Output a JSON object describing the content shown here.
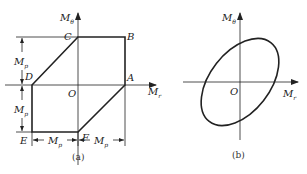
{
  "panel_a": {
    "caption": "(a)",
    "axis_y_label": "M",
    "axis_y_sub": "θ",
    "axis_x_label": "M",
    "axis_x_sub": "r",
    "origin_label": "O",
    "points": {
      "A": "A",
      "B": "B",
      "C": "C",
      "D": "D",
      "E": "E",
      "F": "F"
    },
    "dim_label": "M",
    "dim_sub": "p"
  },
  "panel_b": {
    "caption": "(b)",
    "axis_y_label": "M",
    "axis_y_sub": "θ",
    "axis_x_label": "M",
    "axis_x_sub": "r",
    "origin_label": "O"
  },
  "colors": {
    "stroke": "#222222"
  }
}
